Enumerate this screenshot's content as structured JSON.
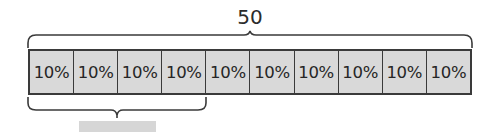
{
  "diagram": {
    "total_label": "50",
    "segments": [
      "10%",
      "10%",
      "10%",
      "10%",
      "10%",
      "10%",
      "10%",
      "10%",
      "10%",
      "10%"
    ],
    "bottom_brace_span_segments": 4,
    "answer_box": "",
    "colors": {
      "segment_fill": "#d9d9d9",
      "outline": "#3a3a3a",
      "answer_box": "#d6d6d6"
    }
  }
}
